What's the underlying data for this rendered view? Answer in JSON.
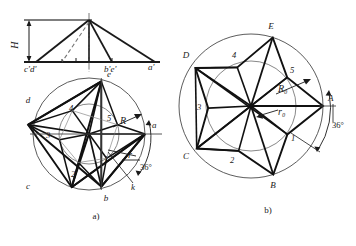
{
  "figure": {
    "type": "engineering-drawing",
    "captions": [
      {
        "id": "caption-a",
        "label": "a)",
        "x": 96,
        "y": 218
      },
      {
        "id": "caption-b",
        "label": "b)",
        "x": 268,
        "y": 212
      }
    ],
    "elevation": {
      "name": "front-view-elevation",
      "height_label": "H",
      "axis_labels": [
        {
          "text": "c'd'",
          "x": 24,
          "y": 72
        },
        {
          "text": "b'e'",
          "x": 104,
          "y": 72
        },
        {
          "text": "a'",
          "x": 150,
          "y": 70
        }
      ],
      "apex": {
        "x": 89,
        "y": 20
      },
      "base_left": {
        "x": 36,
        "y": 62
      },
      "base_right": {
        "x": 155,
        "y": 62
      },
      "base_mid_1": {
        "x": 89,
        "y": 62
      },
      "base_mid_2": {
        "x": 112,
        "y": 62
      },
      "dimension_H": {
        "top": 20,
        "bottom": 62,
        "x": 28
      }
    },
    "figure_a": {
      "name": "pentagram-construction",
      "center": {
        "x": 89,
        "y": 134
      },
      "R_outer": 56,
      "r_inner": 30,
      "labels_outer": [
        {
          "text": "e",
          "x": 109,
          "y": 77
        },
        {
          "text": "a",
          "x": 152,
          "y": 128
        },
        {
          "text": "b",
          "x": 110,
          "y": 200
        },
        {
          "text": "c",
          "x": 32,
          "y": 186
        },
        {
          "text": "d",
          "x": 31,
          "y": 100
        }
      ],
      "labels_inner": [
        {
          "text": "5",
          "x": 107,
          "y": 120
        },
        {
          "text": "1",
          "x": 105,
          "y": 158
        },
        {
          "text": "2",
          "x": 72,
          "y": 175
        },
        {
          "text": "3",
          "x": 46,
          "y": 136
        },
        {
          "text": "4",
          "x": 72,
          "y": 113
        }
      ],
      "radius_labels": [
        {
          "text": "R",
          "x": 122,
          "y": 122
        },
        {
          "text": "r",
          "x": 124,
          "y": 157
        }
      ],
      "angle_label": "36°",
      "point_k": "k"
    },
    "figure_b": {
      "name": "decagram-construction",
      "center": {
        "x": 251,
        "y": 106
      },
      "R_outer": 72,
      "r_inner": 45,
      "labels_outer": [
        {
          "text": "E",
          "x": 271,
          "y": 30
        },
        {
          "text": "A",
          "x": 326,
          "y": 101
        },
        {
          "text": "B",
          "x": 273,
          "y": 185
        },
        {
          "text": "C",
          "x": 182,
          "y": 155
        },
        {
          "text": "D",
          "x": 184,
          "y": 57
        }
      ],
      "labels_inner": [
        {
          "text": "5",
          "x": 290,
          "y": 79
        },
        {
          "text": "1",
          "x": 291,
          "y": 138
        },
        {
          "text": "2",
          "x": 235,
          "y": 159
        },
        {
          "text": "3",
          "x": 197,
          "y": 110
        },
        {
          "text": "4",
          "x": 236,
          "y": 61
        }
      ],
      "radius_labels": [
        {
          "text": "R₀",
          "x": 282,
          "y": 90
        },
        {
          "text": "r₀",
          "x": 281,
          "y": 117
        }
      ],
      "angle_label": "36°"
    },
    "colors": {
      "ink": "#1a1a1a",
      "thin_line": "#3a3a3a",
      "background": "#ffffff"
    }
  }
}
